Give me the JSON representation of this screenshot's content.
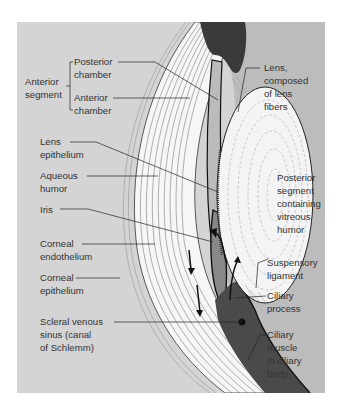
{
  "figure": {
    "colors": {
      "page_background": "#ffffff",
      "panel_background_left": "#d4d4d4",
      "panel_background_right": "#bcbcbc",
      "tissue_white": "#f4f4f4",
      "ink": "#222222",
      "label_text": "#333333"
    }
  },
  "labels": {
    "left": {
      "anterior_segment": "Anterior\nsegment",
      "posterior_chamber": "Posterior\nchamber",
      "anterior_chamber": "Anterior\nchamber",
      "lens_epithelium": "Lens\nepithelium",
      "aqueous_humor": "Aqueous\nhumor",
      "iris": "Iris",
      "corneal_endothelium": "Corneal\nendothelium",
      "corneal_epithelium": "Corneal\nepithelium",
      "scleral_venous_sinus": "Scleral venous\nsinus (canal\nof Schlemm)"
    },
    "right": {
      "lens": "Lens,\ncomposed\nof lens\nfibers",
      "posterior_segment": "Posterior\nsegment\ncontaining\nvitreous\nhumor",
      "suspensory_ligament": "Suspensory\nligament",
      "ciliary_process": "Ciliary\nprocess",
      "ciliary_muscle": "Ciliary\nmuscle\nin ciliary\nbody"
    }
  }
}
